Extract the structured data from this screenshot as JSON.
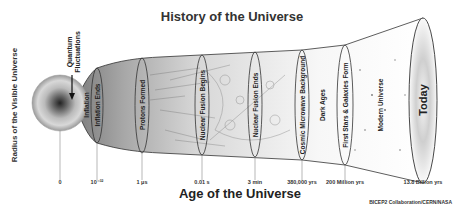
{
  "title": "History of the Universe",
  "y_axis_label": "Radius of the Visible Universe",
  "x_axis_label": "Age of the Universe",
  "annotation": {
    "line1": "Quantum",
    "line2": "Fluctuations"
  },
  "neck_label": "Inflation",
  "epochs": [
    {
      "label": "Inflation Ends",
      "time": "10⁻³²"
    },
    {
      "label": "Protons Formed",
      "time": "1 μs"
    },
    {
      "label": "Nuclear Fusion Begins",
      "time": "0.01 s"
    },
    {
      "label": "Nuclear Fusion Ends",
      "time": "3 min"
    },
    {
      "label": "Cosmic Microwave Background",
      "time": "380,000 yrs"
    },
    {
      "label": "First Stars & Galaxies Form",
      "time": "200 Million yrs"
    },
    {
      "label": "Today",
      "time": "13.8 Billion yrs"
    }
  ],
  "origin_tick": "0",
  "eras": [
    {
      "label": "Dark Ages"
    },
    {
      "label": "Modern Universe"
    }
  ],
  "credit": "BICEP2 Collaboration/CERN/NASA",
  "colors": {
    "ink": "#333333",
    "funnel_dark": "#8a8a8a",
    "funnel_light": "#f4f4f4"
  }
}
